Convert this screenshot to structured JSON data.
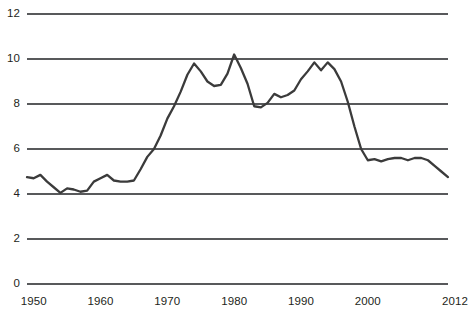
{
  "chart_data": {
    "type": "line",
    "title": "",
    "subtitle": "",
    "xlabel": "",
    "ylabel": "",
    "xlim": [
      1949,
      2012
    ],
    "ylim": [
      0,
      12
    ],
    "grid": "horizontal",
    "legend": "none",
    "line_color": "#3b3b3b",
    "grid_color": "#58595b",
    "axis_color": "#58595b",
    "text_color": "#231f20",
    "background": "#ffffff",
    "ytick_labels": [
      "0",
      "2",
      "4",
      "6",
      "8",
      "10",
      "12"
    ],
    "ytick_values": [
      0,
      2,
      4,
      6,
      8,
      10,
      12
    ],
    "xtick_labels": [
      "1950",
      "1960",
      "1970",
      "1980",
      "1990",
      "2000",
      "2012"
    ],
    "xtick_values": [
      1950,
      1960,
      1970,
      1980,
      1990,
      2000,
      2012
    ],
    "series": [
      {
        "name": "series-1",
        "x": [
          1949,
          1950,
          1951,
          1952,
          1953,
          1954,
          1955,
          1956,
          1957,
          1958,
          1959,
          1960,
          1961,
          1962,
          1963,
          1964,
          1965,
          1966,
          1967,
          1968,
          1969,
          1970,
          1971,
          1972,
          1973,
          1974,
          1975,
          1976,
          1977,
          1978,
          1979,
          1980,
          1981,
          1982,
          1983,
          1984,
          1985,
          1986,
          1987,
          1988,
          1989,
          1990,
          1991,
          1992,
          1993,
          1994,
          1995,
          1996,
          1997,
          1998,
          1999,
          2000,
          2001,
          2002,
          2003,
          2004,
          2005,
          2006,
          2007,
          2008,
          2009,
          2010,
          2011,
          2012
        ],
        "y": [
          4.75,
          4.7,
          4.85,
          4.55,
          4.3,
          4.05,
          4.25,
          4.2,
          4.1,
          4.15,
          4.55,
          4.7,
          4.85,
          4.6,
          4.55,
          4.55,
          4.6,
          5.1,
          5.65,
          6.0,
          6.6,
          7.35,
          7.9,
          8.55,
          9.3,
          9.8,
          9.45,
          9.0,
          8.8,
          8.85,
          9.35,
          10.2,
          9.6,
          8.9,
          7.9,
          7.85,
          8.05,
          8.45,
          8.3,
          8.4,
          8.6,
          9.1,
          9.45,
          9.85,
          9.5,
          9.85,
          9.55,
          9.0,
          8.1,
          7.0,
          6.0,
          5.5,
          5.55,
          5.45,
          5.55,
          5.6,
          5.6,
          5.5,
          5.6,
          5.6,
          5.5,
          5.25,
          5.0,
          4.75
        ]
      }
    ]
  }
}
